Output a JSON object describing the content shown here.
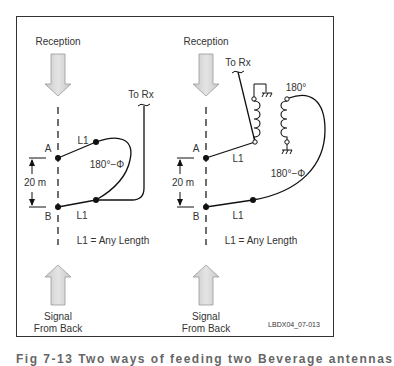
{
  "left_panel": {
    "top_label": "Reception",
    "rx_label": "To Rx",
    "point_a": "A",
    "point_b": "B",
    "l1_top": "L1",
    "l1_bottom": "L1",
    "phase": "180°−Φ",
    "spacing": "20 m",
    "note": "L1 = Any Length",
    "bottom_label_1": "Signal",
    "bottom_label_2": "From Back"
  },
  "right_panel": {
    "top_label": "Reception",
    "rx_label": "To Rx",
    "point_a": "A",
    "point_b": "B",
    "l1_top": "L1",
    "l1_bottom": "L1",
    "phase_transformer": "180°",
    "phase": "180°−Φ",
    "spacing": "20 m",
    "note": "L1 = Any Length",
    "bottom_label_1": "Signal",
    "bottom_label_2": "From Back"
  },
  "figure_id": "LBDX04_07-013",
  "caption_partial": "Fig 7-13   Two ways of feeding two Beverage antennas"
}
